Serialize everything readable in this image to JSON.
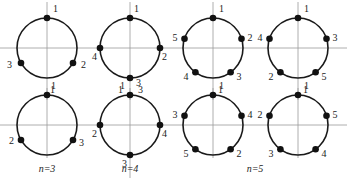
{
  "figure": {
    "width": 347,
    "height": 187,
    "radius": 30,
    "colors": {
      "ring": "#1a1a1a",
      "dot": "#111111",
      "axis": "#9a9a9a",
      "text": "#222222"
    },
    "axes": {
      "rows": [
        {
          "y": 48,
          "x1": 0,
          "x2": 347
        },
        {
          "y": 125,
          "x1": 0,
          "x2": 347
        }
      ],
      "cols": [
        {
          "x": 47,
          "y1": 2,
          "y2": 100
        },
        {
          "x": 130,
          "y1": 2,
          "y2": 100
        },
        {
          "x": 213,
          "y1": 2,
          "y2": 100
        },
        {
          "x": 298,
          "y1": 2,
          "y2": 100
        },
        {
          "x": 47,
          "y1": 88,
          "y2": 158
        },
        {
          "x": 130,
          "y1": 88,
          "y2": 178
        },
        {
          "x": 213,
          "y1": 88,
          "y2": 158
        },
        {
          "x": 298,
          "y1": 88,
          "y2": 158
        }
      ]
    },
    "circles": [
      {
        "id": "n3-top",
        "cx": 47,
        "cy": 48,
        "points": [
          {
            "label": "1",
            "angle": 90,
            "lx": 6,
            "ly": -6
          },
          {
            "label": "2",
            "angle": -30,
            "lx": 8,
            "ly": 5
          },
          {
            "label": "3",
            "angle": 210,
            "lx": -14,
            "ly": 5
          }
        ]
      },
      {
        "id": "n4-top",
        "cx": 130,
        "cy": 48,
        "points": [
          {
            "label": "1",
            "angle": 90,
            "lx": 4,
            "ly": -6
          },
          {
            "label": "2",
            "angle": 0,
            "lx": 2,
            "ly": 12
          },
          {
            "label": "3",
            "angle": -90,
            "lx": 6,
            "ly": 8
          },
          {
            "label": "4",
            "angle": 180,
            "lx": -8,
            "ly": 12
          }
        ]
      },
      {
        "id": "n5-top",
        "cx": 213,
        "cy": 48,
        "points": [
          {
            "label": "1",
            "angle": 90,
            "lx": 6,
            "ly": -6
          },
          {
            "label": "2",
            "angle": 18,
            "lx": 6,
            "ly": 2
          },
          {
            "label": "3",
            "angle": -54,
            "lx": 6,
            "ly": 8
          },
          {
            "label": "4",
            "angle": -126,
            "lx": -12,
            "ly": 8
          },
          {
            "label": "5",
            "angle": 162,
            "lx": -12,
            "ly": 2
          }
        ]
      },
      {
        "id": "n5b-top",
        "cx": 298,
        "cy": 48,
        "points": [
          {
            "label": "1",
            "angle": 90,
            "lx": 6,
            "ly": -6
          },
          {
            "label": "3",
            "angle": 18,
            "lx": 6,
            "ly": 2
          },
          {
            "label": "5",
            "angle": -54,
            "lx": 6,
            "ly": 8
          },
          {
            "label": "2",
            "angle": -126,
            "lx": -12,
            "ly": 8
          },
          {
            "label": "4",
            "angle": 162,
            "lx": -12,
            "ly": 2
          }
        ]
      },
      {
        "id": "n3-bottom",
        "cx": 47,
        "cy": 125,
        "points": [
          {
            "label": "1",
            "angle": 90,
            "lx": 4,
            "ly": -6
          },
          {
            "label": "3",
            "angle": -30,
            "lx": 6,
            "ly": 6
          },
          {
            "label": "2",
            "angle": 210,
            "lx": -12,
            "ly": 4
          }
        ]
      },
      {
        "id": "n4-bottom",
        "cx": 130,
        "cy": 125,
        "points": [
          {
            "label": "1",
            "angle": 90,
            "lx": -10,
            "ly": -6
          },
          {
            "label": "4",
            "angle": 0,
            "lx": 2,
            "ly": 12
          },
          {
            "label": "3",
            "angle": -90,
            "lx": -8,
            "ly": 12
          },
          {
            "label": "2",
            "angle": 180,
            "lx": -8,
            "ly": 12
          }
        ]
      },
      {
        "id": "n5-bottom",
        "cx": 213,
        "cy": 125,
        "points": [
          {
            "label": "1",
            "angle": 90,
            "lx": 6,
            "ly": -6
          },
          {
            "label": "4",
            "angle": 18,
            "lx": 6,
            "ly": 2
          },
          {
            "label": "2",
            "angle": -54,
            "lx": 6,
            "ly": 8
          },
          {
            "label": "5",
            "angle": -126,
            "lx": -12,
            "ly": 8
          },
          {
            "label": "3",
            "angle": 162,
            "lx": -12,
            "ly": 2
          }
        ]
      },
      {
        "id": "n5b-bottom",
        "cx": 298,
        "cy": 125,
        "points": [
          {
            "label": "1",
            "angle": 90,
            "lx": 6,
            "ly": -6
          },
          {
            "label": "5",
            "angle": 18,
            "lx": 6,
            "ly": 2
          },
          {
            "label": "4",
            "angle": -54,
            "lx": 6,
            "ly": 8
          },
          {
            "label": "3",
            "angle": -126,
            "lx": -12,
            "ly": 8
          },
          {
            "label": "2",
            "angle": 162,
            "lx": -12,
            "ly": 2
          }
        ]
      }
    ],
    "captions": [
      {
        "text": "n=3",
        "x": 47,
        "y": 172
      },
      {
        "text": "n=4",
        "x": 130,
        "y": 172
      },
      {
        "text": "n=5",
        "x": 255,
        "y": 172
      }
    ],
    "extra_labels": [
      {
        "text": "1",
        "x": 50,
        "y": 93
      },
      {
        "text": "1",
        "x": 118,
        "y": 93
      },
      {
        "text": "3",
        "x": 138,
        "y": 93
      },
      {
        "text": "1",
        "x": 218,
        "y": 93
      },
      {
        "text": "1",
        "x": 303,
        "y": 93
      }
    ]
  }
}
